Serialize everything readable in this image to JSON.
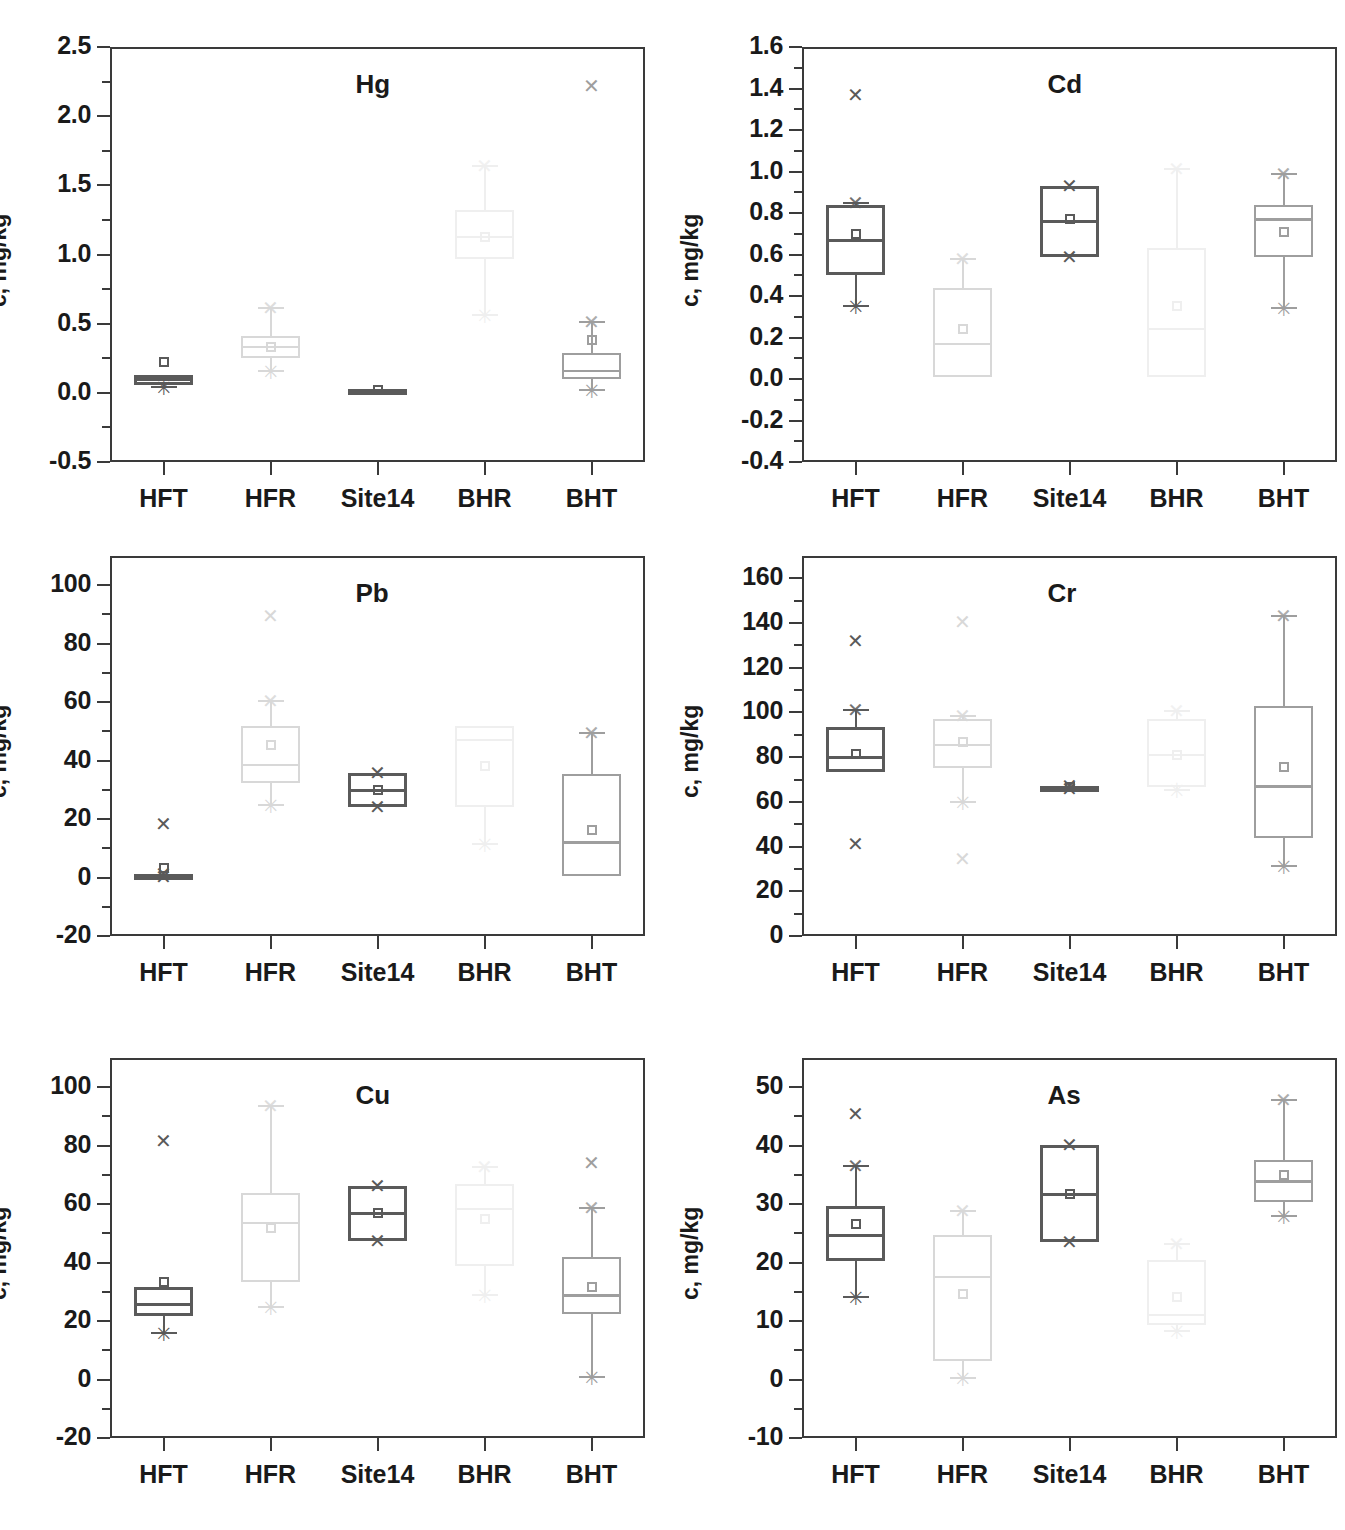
{
  "figure": {
    "ylabel": "c, mg/kg",
    "categories": [
      "HFT",
      "HFR",
      "Site14",
      "BHR",
      "BHT"
    ],
    "colors": {
      "dark": "#5a5a5a",
      "mid": "#9e9e9e",
      "light": "#d8d8d8",
      "faint": "#efefef",
      "axis": "#3a3a3a"
    }
  },
  "chart_data": [
    {
      "type": "box",
      "title": "Hg",
      "xlabel": "",
      "ylabel": "c, mg/kg",
      "ylim": [
        -0.5,
        2.5
      ],
      "yticks": [
        -0.5,
        0.0,
        0.5,
        1.0,
        1.5,
        2.0,
        2.5
      ],
      "ytick_labels": [
        "-0.5",
        "0.0",
        "0.5",
        "1.0",
        "1.5",
        "2.0",
        "2.5"
      ],
      "categories": [
        "HFT",
        "HFR",
        "Site14",
        "BHR",
        "BHT"
      ],
      "boxes": [
        {
          "name": "HFT",
          "q1": 0.06,
          "median": 0.1,
          "q3": 0.13,
          "mean": 0.22,
          "whisker_low": 0.04,
          "whisker_high": 0.13,
          "outliers": [],
          "shade": "dark"
        },
        {
          "name": "HFR",
          "q1": 0.25,
          "median": 0.33,
          "q3": 0.41,
          "mean": 0.33,
          "whisker_low": 0.16,
          "whisker_high": 0.61,
          "outliers": [],
          "shade": "light"
        },
        {
          "name": "Site14",
          "q1": 0.01,
          "median": 0.02,
          "q3": 0.03,
          "mean": 0.02,
          "whisker_low": 0.02,
          "whisker_high": 0.03,
          "outliers": [],
          "shade": "dark"
        },
        {
          "name": "BHR",
          "q1": 0.97,
          "median": 1.13,
          "q3": 1.32,
          "mean": 1.13,
          "whisker_low": 0.56,
          "whisker_high": 1.64,
          "outliers": [],
          "shade": "faint"
        },
        {
          "name": "BHT",
          "q1": 0.1,
          "median": 0.16,
          "q3": 0.29,
          "mean": 0.38,
          "whisker_low": 0.02,
          "whisker_high": 0.51,
          "outliers": [
            2.22
          ],
          "shade": "mid"
        }
      ]
    },
    {
      "type": "box",
      "title": "Cd",
      "xlabel": "",
      "ylabel": "c, mg/kg",
      "ylim": [
        -0.4,
        1.6
      ],
      "yticks": [
        -0.4,
        -0.2,
        0.0,
        0.2,
        0.4,
        0.6,
        0.8,
        1.0,
        1.2,
        1.4,
        1.6
      ],
      "ytick_labels": [
        "-0.4",
        "-0.2",
        "0.0",
        "0.2",
        "0.4",
        "0.6",
        "0.8",
        "1.0",
        "1.2",
        "1.4",
        "1.6"
      ],
      "categories": [
        "HFT",
        "HFR",
        "Site14",
        "BHR",
        "BHT"
      ],
      "boxes": [
        {
          "name": "HFT",
          "q1": 0.5,
          "median": 0.67,
          "q3": 0.84,
          "mean": 0.7,
          "whisker_low": 0.35,
          "whisker_high": 0.85,
          "outliers": [
            1.37
          ],
          "shade": "dark"
        },
        {
          "name": "HFR",
          "q1": 0.01,
          "median": 0.17,
          "q3": 0.44,
          "mean": 0.24,
          "whisker_low": 0.01,
          "whisker_high": 0.58,
          "outliers": [],
          "shade": "light"
        },
        {
          "name": "Site14",
          "q1": 0.59,
          "median": 0.76,
          "q3": 0.93,
          "mean": 0.77,
          "whisker_low": 0.59,
          "whisker_high": 0.93,
          "outliers": [],
          "shade": "dark"
        },
        {
          "name": "BHR",
          "q1": 0.01,
          "median": 0.24,
          "q3": 0.63,
          "mean": 0.35,
          "whisker_low": 0.01,
          "whisker_high": 1.01,
          "outliers": [],
          "shade": "faint"
        },
        {
          "name": "BHT",
          "q1": 0.59,
          "median": 0.77,
          "q3": 0.84,
          "mean": 0.71,
          "whisker_low": 0.34,
          "whisker_high": 0.99,
          "outliers": [],
          "shade": "mid"
        }
      ]
    },
    {
      "type": "box",
      "title": "Pb",
      "xlabel": "",
      "ylabel": "c, mg/kg",
      "ylim": [
        -20,
        110
      ],
      "yticks": [
        -20,
        0,
        20,
        40,
        60,
        80,
        100
      ],
      "ytick_labels": [
        "-20",
        "0",
        "20",
        "40",
        "60",
        "80",
        "100"
      ],
      "categories": [
        "HFT",
        "HFR",
        "Site14",
        "BHR",
        "BHT"
      ],
      "boxes": [
        {
          "name": "HFT",
          "q1": 0.3,
          "median": 0.8,
          "q3": 1.3,
          "mean": 3.3,
          "whisker_low": 0.3,
          "whisker_high": 1.3,
          "outliers": [
            18.3
          ],
          "shade": "dark"
        },
        {
          "name": "HFR",
          "q1": 32.2,
          "median": 38.5,
          "q3": 52.0,
          "mean": 45.5,
          "whisker_low": 24.7,
          "whisker_high": 60.5,
          "outliers": [
            89.5
          ],
          "shade": "light"
        },
        {
          "name": "Site14",
          "q1": 24.2,
          "median": 30.0,
          "q3": 35.8,
          "mean": 30.0,
          "whisker_low": 24.2,
          "whisker_high": 35.8,
          "outliers": [],
          "shade": "dark"
        },
        {
          "name": "BHR",
          "q1": 24.0,
          "median": 47.0,
          "q3": 52.0,
          "mean": 38.0,
          "whisker_low": 11.5,
          "whisker_high": 52.0,
          "outliers": [],
          "shade": "faint"
        },
        {
          "name": "BHT",
          "q1": 0.6,
          "median": 12.0,
          "q3": 35.3,
          "mean": 16.4,
          "whisker_low": 0.6,
          "whisker_high": 49.5,
          "outliers": [],
          "shade": "mid"
        }
      ]
    },
    {
      "type": "box",
      "title": "Cr",
      "xlabel": "",
      "ylabel": "c, mg/kg",
      "ylim": [
        0,
        170
      ],
      "yticks": [
        0,
        20,
        40,
        60,
        80,
        100,
        120,
        140,
        160
      ],
      "ytick_labels": [
        "0",
        "20",
        "40",
        "60",
        "80",
        "100",
        "120",
        "140",
        "160"
      ],
      "categories": [
        "HFT",
        "HFR",
        "Site14",
        "BHR",
        "BHT"
      ],
      "boxes": [
        {
          "name": "HFT",
          "q1": 73.5,
          "median": 80.0,
          "q3": 93.5,
          "mean": 81.5,
          "whisker_low": 73.5,
          "whisker_high": 101.0,
          "outliers": [
            132.0,
            41.0
          ],
          "shade": "dark"
        },
        {
          "name": "HFR",
          "q1": 75.0,
          "median": 85.5,
          "q3": 97.0,
          "mean": 87.0,
          "whisker_low": 60.0,
          "whisker_high": 98.5,
          "outliers": [
            140.5,
            34.5
          ],
          "shade": "light"
        },
        {
          "name": "Site14",
          "q1": 65.8,
          "median": 66.5,
          "q3": 67.2,
          "mean": 66.5,
          "whisker_low": 65.8,
          "whisker_high": 67.2,
          "outliers": [],
          "shade": "dark"
        },
        {
          "name": "BHR",
          "q1": 66.5,
          "median": 81.0,
          "q3": 97.0,
          "mean": 81.0,
          "whisker_low": 65.5,
          "whisker_high": 100.5,
          "outliers": [],
          "shade": "faint"
        },
        {
          "name": "BHT",
          "q1": 44.0,
          "median": 67.0,
          "q3": 103.0,
          "mean": 75.5,
          "whisker_low": 31.5,
          "whisker_high": 143.0,
          "outliers": [],
          "shade": "mid"
        }
      ]
    },
    {
      "type": "box",
      "title": "Cu",
      "xlabel": "",
      "ylabel": "c, mg/kg",
      "ylim": [
        -20,
        110
      ],
      "yticks": [
        -20,
        0,
        20,
        40,
        60,
        80,
        100
      ],
      "ytick_labels": [
        "-20",
        "0",
        "20",
        "40",
        "60",
        "80",
        "100"
      ],
      "categories": [
        "HFT",
        "HFR",
        "Site14",
        "BHR",
        "BHT"
      ],
      "boxes": [
        {
          "name": "HFT",
          "q1": 21.8,
          "median": 25.8,
          "q3": 31.5,
          "mean": 33.3,
          "whisker_low": 15.8,
          "whisker_high": 31.5,
          "outliers": [
            81.5
          ],
          "shade": "dark"
        },
        {
          "name": "HFR",
          "q1": 33.2,
          "median": 53.5,
          "q3": 63.8,
          "mean": 51.8,
          "whisker_low": 24.8,
          "whisker_high": 93.5,
          "outliers": [],
          "shade": "light"
        },
        {
          "name": "Site14",
          "q1": 47.5,
          "median": 57.0,
          "q3": 66.2,
          "mean": 57.0,
          "whisker_low": 47.5,
          "whisker_high": 66.2,
          "outliers": [],
          "shade": "dark"
        },
        {
          "name": "BHR",
          "q1": 39.0,
          "median": 58.5,
          "q3": 67.0,
          "mean": 55.0,
          "whisker_low": 28.8,
          "whisker_high": 72.8,
          "outliers": [],
          "shade": "faint"
        },
        {
          "name": "BHT",
          "q1": 22.5,
          "median": 28.8,
          "q3": 41.8,
          "mean": 31.5,
          "whisker_low": 1.0,
          "whisker_high": 58.8,
          "outliers": [
            74.2
          ],
          "shade": "mid"
        }
      ]
    },
    {
      "type": "box",
      "title": "As",
      "xlabel": "",
      "ylabel": "c, mg/kg",
      "ylim": [
        -10,
        55
      ],
      "yticks": [
        -10,
        0,
        10,
        20,
        30,
        40,
        50
      ],
      "ytick_labels": [
        "-10",
        "0",
        "10",
        "20",
        "30",
        "40",
        "50"
      ],
      "categories": [
        "HFT",
        "HFR",
        "Site14",
        "BHR",
        "BHT"
      ],
      "boxes": [
        {
          "name": "HFT",
          "q1": 20.2,
          "median": 24.8,
          "q3": 29.7,
          "mean": 26.6,
          "whisker_low": 14.2,
          "whisker_high": 36.6,
          "outliers": [
            45.5
          ],
          "shade": "dark"
        },
        {
          "name": "HFR",
          "q1": 3.1,
          "median": 17.5,
          "q3": 24.7,
          "mean": 14.6,
          "whisker_low": 0.3,
          "whisker_high": 28.8,
          "outliers": [],
          "shade": "light"
        },
        {
          "name": "Site14",
          "q1": 23.5,
          "median": 31.8,
          "q3": 40.2,
          "mean": 31.8,
          "whisker_low": 23.5,
          "whisker_high": 40.2,
          "outliers": [],
          "shade": "dark"
        },
        {
          "name": "BHR",
          "q1": 9.3,
          "median": 11.0,
          "q3": 20.5,
          "mean": 14.2,
          "whisker_low": 8.3,
          "whisker_high": 23.2,
          "outliers": [],
          "shade": "faint"
        },
        {
          "name": "BHT",
          "q1": 30.3,
          "median": 33.9,
          "q3": 37.5,
          "mean": 35.0,
          "whisker_low": 28.0,
          "whisker_high": 47.8,
          "outliers": [],
          "shade": "mid"
        }
      ]
    }
  ]
}
